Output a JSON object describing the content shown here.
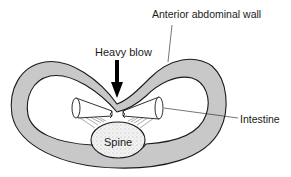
{
  "diagram": {
    "labels": {
      "anterior_abdominal_wall": "Anterior abdominal wall",
      "heavy_blow": "Heavy blow",
      "intestine": "Intestine",
      "spine": "Spine"
    },
    "colors": {
      "wall_fill": "#c8c8c8",
      "outline": "#1a1a1a",
      "background": "#ffffff"
    }
  }
}
